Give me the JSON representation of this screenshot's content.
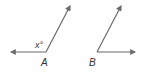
{
  "diagram": {
    "type": "angle-pair",
    "stroke_color": "#6b6b6b",
    "angles": [
      {
        "label": "A",
        "measure_label": "x°",
        "vertex": [
          46,
          52
        ],
        "rays": [
          [
            10,
            52
          ],
          [
            71,
            5
          ]
        ],
        "kind": "obtuse"
      },
      {
        "label": "B",
        "measure_label": "",
        "vertex": [
          97,
          52
        ],
        "rays": [
          [
            122,
            5
          ],
          [
            136,
            52
          ]
        ],
        "kind": "acute"
      }
    ]
  }
}
